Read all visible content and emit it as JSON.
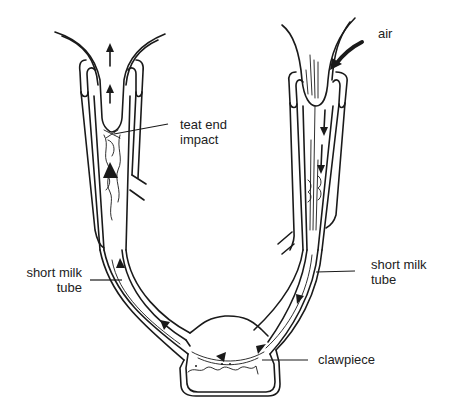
{
  "figure": {
    "labels": {
      "air": "air",
      "teat_end_impact": [
        "teat end",
        "impact"
      ],
      "short_milk_tube_left": [
        "short milk",
        "tube"
      ],
      "short_milk_tube_right": [
        "short milk",
        "tube"
      ],
      "clawpiece": "clawpiece"
    },
    "flow_arrows": {
      "left_cup": "upward (milk forced toward teat end)",
      "right_cup": "downward (air admitted, milk flows to claw)",
      "clawpiece": "circulating toward left outlet"
    },
    "colors": {
      "line": "#1a1a1a",
      "background": "#ffffff",
      "text": "#222222"
    }
  }
}
